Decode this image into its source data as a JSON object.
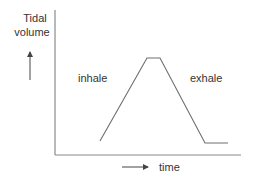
{
  "diagram": {
    "y_axis_label_line1": "Tidal",
    "y_axis_label_line2": "volume",
    "x_axis_label": "time",
    "phase_inhale": "inhale",
    "phase_exhale": "exhale",
    "colors": {
      "line": "#707070",
      "axis": "#808080",
      "text": "#333333"
    },
    "curve_points": [
      [
        100,
        141
      ],
      [
        147,
        58
      ],
      [
        160,
        58
      ],
      [
        205,
        143
      ],
      [
        228,
        143
      ]
    ]
  }
}
